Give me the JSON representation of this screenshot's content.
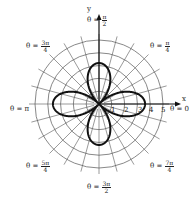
{
  "chart_data": {
    "type": "line",
    "subtype": "polar",
    "title": "",
    "curve": {
      "equation_form": "r = a·|cos(2θ)|",
      "petals": 4,
      "petal_directions": [
        "θ=0",
        "θ=π/2",
        "θ=π",
        "θ=3π/2"
      ],
      "approx_max_r_horizontal": 3.6,
      "approx_max_r_vertical": 3.2
    },
    "radial_ticks": [
      "1",
      "2",
      "3",
      "4",
      "5"
    ],
    "rmax": 5,
    "axes": {
      "x_label": "x",
      "y_label": "y"
    },
    "angle_labels": [
      {
        "id": "a0",
        "prefix": "θ = ",
        "text": "0"
      },
      {
        "id": "a1",
        "prefix": "θ = ",
        "num": "π",
        "den": "4"
      },
      {
        "id": "a2",
        "prefix": "θ = ",
        "num": "π",
        "den": "2"
      },
      {
        "id": "a3",
        "prefix": "θ = ",
        "num": "3π",
        "den": "4"
      },
      {
        "id": "a4",
        "prefix": "θ = ",
        "text": "π"
      },
      {
        "id": "a5",
        "prefix": "θ = ",
        "num": "5π",
        "den": "4"
      },
      {
        "id": "a6",
        "prefix": "θ = ",
        "num": "3π",
        "den": "2"
      },
      {
        "id": "a7",
        "prefix": "θ = ",
        "num": "7π",
        "den": "4"
      }
    ],
    "grid": {
      "circles": 5,
      "radial_lines_every_deg": 15
    },
    "colors": {
      "curve": "#111111",
      "grid": "#555555"
    }
  }
}
